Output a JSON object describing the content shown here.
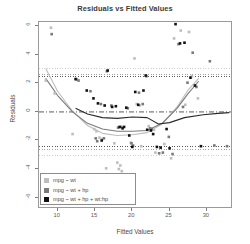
{
  "chart_data": {
    "type": "scatter",
    "title": "Residuals vs Fitted Values",
    "xlabel": "Fitted Values",
    "ylabel": "Residuals",
    "xlim": [
      7.5,
      33.5
    ],
    "ylim": [
      -6.8,
      6.3
    ],
    "xticks": [
      10,
      15,
      20,
      25,
      30
    ],
    "yticks": [
      6,
      4,
      2,
      0,
      -2,
      -4,
      -6
    ],
    "grid": false,
    "legend_position": "bottom-left",
    "zero_line": 0,
    "series": [
      {
        "name": "mpg ~ wt",
        "color": "#bdbdbd",
        "sd_band": [
          3.05,
          -3.05
        ],
        "points": [
          {
            "x": 8.4,
            "y": 2.2
          },
          {
            "x": 9.1,
            "y": 5.9
          },
          {
            "x": 9.6,
            "y": 1.3
          },
          {
            "x": 12.0,
            "y": -1.55
          },
          {
            "x": 12.6,
            "y": 2.25
          },
          {
            "x": 14.9,
            "y": -1.2
          },
          {
            "x": 15.2,
            "y": -1.35
          },
          {
            "x": 15.6,
            "y": -1.8
          },
          {
            "x": 16.0,
            "y": -1.9
          },
          {
            "x": 16.5,
            "y": -3.95
          },
          {
            "x": 17.6,
            "y": -2.2
          },
          {
            "x": 18.0,
            "y": -3.55
          },
          {
            "x": 18.2,
            "y": -4.0
          },
          {
            "x": 18.4,
            "y": -3.75
          },
          {
            "x": 18.6,
            "y": -4.15
          },
          {
            "x": 19.0,
            "y": -4.75
          },
          {
            "x": 19.8,
            "y": -2.15
          },
          {
            "x": 20.3,
            "y": 3.75
          },
          {
            "x": 20.6,
            "y": 0.55
          },
          {
            "x": 21.0,
            "y": 0.45
          },
          {
            "x": 21.2,
            "y": -2.4
          },
          {
            "x": 22.2,
            "y": -1.0
          },
          {
            "x": 22.9,
            "y": -1.25
          },
          {
            "x": 23.1,
            "y": -2.85
          },
          {
            "x": 24.3,
            "y": -2.25
          },
          {
            "x": 25.2,
            "y": -3.25
          },
          {
            "x": 25.6,
            "y": 5.15
          },
          {
            "x": 26.5,
            "y": 5.7
          },
          {
            "x": 27.1,
            "y": 0.5
          },
          {
            "x": 27.6,
            "y": 5.6
          },
          {
            "x": 28.0,
            "y": 2.5
          },
          {
            "x": 28.8,
            "y": 0.95
          }
        ]
      },
      {
        "name": "mpg ~ wt + hp",
        "color": "#7a7a7a",
        "sd_band": [
          2.65,
          -2.65
        ],
        "points": [
          {
            "x": 9.2,
            "y": 5.45
          },
          {
            "x": 12.5,
            "y": 2.3
          },
          {
            "x": 12.8,
            "y": 2.2
          },
          {
            "x": 14.4,
            "y": 1.45
          },
          {
            "x": 15.1,
            "y": -1.85
          },
          {
            "x": 15.3,
            "y": -2.05
          },
          {
            "x": 15.8,
            "y": 0.55
          },
          {
            "x": 16.2,
            "y": -1.85
          },
          {
            "x": 16.6,
            "y": 2.85
          },
          {
            "x": 17.2,
            "y": 0.45
          },
          {
            "x": 18.1,
            "y": -1.1
          },
          {
            "x": 18.5,
            "y": -1.05
          },
          {
            "x": 19.4,
            "y": 0.25
          },
          {
            "x": 19.9,
            "y": -2.2
          },
          {
            "x": 20.1,
            "y": -2.35
          },
          {
            "x": 20.9,
            "y": 1.35
          },
          {
            "x": 21.4,
            "y": 0.55
          },
          {
            "x": 21.9,
            "y": 2.5
          },
          {
            "x": 22.4,
            "y": -1.15
          },
          {
            "x": 22.6,
            "y": -1.2
          },
          {
            "x": 23.6,
            "y": -2.9
          },
          {
            "x": 24.1,
            "y": -2.85
          },
          {
            "x": 24.9,
            "y": -1.75
          },
          {
            "x": 25.4,
            "y": -2.95
          },
          {
            "x": 26.2,
            "y": 4.75
          },
          {
            "x": 26.8,
            "y": 0.35
          },
          {
            "x": 27.4,
            "y": 2.05
          },
          {
            "x": 28.1,
            "y": 4.15
          },
          {
            "x": 28.6,
            "y": 1.75
          },
          {
            "x": 30.4,
            "y": 3.55
          },
          {
            "x": 31.0,
            "y": -2.35
          },
          {
            "x": 32.7,
            "y": -2.4
          }
        ]
      },
      {
        "name": "mpg ~ wt + hp + wt:hp",
        "color": "#111111",
        "sd_band": [
          2.45,
          -2.45
        ],
        "points": [
          {
            "x": 12.4,
            "y": 2.3
          },
          {
            "x": 13.9,
            "y": 1.5
          },
          {
            "x": 14.8,
            "y": 0.95
          },
          {
            "x": 15.4,
            "y": 0.6
          },
          {
            "x": 15.9,
            "y": -2.0
          },
          {
            "x": 16.3,
            "y": 0.45
          },
          {
            "x": 16.7,
            "y": 2.9
          },
          {
            "x": 17.3,
            "y": 0.35
          },
          {
            "x": 17.8,
            "y": 0.4
          },
          {
            "x": 18.3,
            "y": -1.05
          },
          {
            "x": 18.7,
            "y": -1.15
          },
          {
            "x": 18.9,
            "y": -1.05
          },
          {
            "x": 19.2,
            "y": 0.3
          },
          {
            "x": 19.6,
            "y": -1.65
          },
          {
            "x": 20.0,
            "y": -2.45
          },
          {
            "x": 20.4,
            "y": 1.4
          },
          {
            "x": 20.8,
            "y": 0.5
          },
          {
            "x": 21.5,
            "y": 1.5
          },
          {
            "x": 21.8,
            "y": 2.55
          },
          {
            "x": 22.0,
            "y": -1.25
          },
          {
            "x": 22.5,
            "y": -1.3
          },
          {
            "x": 22.8,
            "y": -1.55
          },
          {
            "x": 23.3,
            "y": -2.45
          },
          {
            "x": 23.8,
            "y": -2.5
          },
          {
            "x": 24.6,
            "y": -1.2
          },
          {
            "x": 25.0,
            "y": -2.55
          },
          {
            "x": 25.8,
            "y": 6.15
          },
          {
            "x": 26.4,
            "y": 4.8
          },
          {
            "x": 27.0,
            "y": 4.85
          },
          {
            "x": 27.8,
            "y": 2.4
          },
          {
            "x": 28.4,
            "y": 1.85
          },
          {
            "x": 29.2,
            "y": -2.4
          }
        ]
      }
    ],
    "smoothers": [
      {
        "name": "mpg ~ wt",
        "color": "#bdbdbd",
        "points": [
          {
            "x": 8.4,
            "y": 3.05
          },
          {
            "x": 10.0,
            "y": 1.45
          },
          {
            "x": 12.0,
            "y": 0.05
          },
          {
            "x": 14.0,
            "y": -0.95
          },
          {
            "x": 16.0,
            "y": -1.5
          },
          {
            "x": 18.0,
            "y": -1.65
          },
          {
            "x": 20.0,
            "y": -1.6
          },
          {
            "x": 22.0,
            "y": -1.45
          },
          {
            "x": 24.0,
            "y": -0.85
          },
          {
            "x": 26.0,
            "y": 0.35
          },
          {
            "x": 27.5,
            "y": 1.55
          },
          {
            "x": 28.9,
            "y": 2.35
          }
        ]
      },
      {
        "name": "mpg ~ wt + hp",
        "color": "#7a7a7a",
        "points": [
          {
            "x": 8.4,
            "y": 2.35
          },
          {
            "x": 10.0,
            "y": 1.15
          },
          {
            "x": 12.0,
            "y": 0.0
          },
          {
            "x": 14.0,
            "y": -0.8
          },
          {
            "x": 16.0,
            "y": -1.2
          },
          {
            "x": 18.0,
            "y": -1.35
          },
          {
            "x": 20.0,
            "y": -1.35
          },
          {
            "x": 22.0,
            "y": -1.3
          },
          {
            "x": 24.0,
            "y": -0.8
          },
          {
            "x": 26.0,
            "y": 0.25
          },
          {
            "x": 27.5,
            "y": 1.3
          },
          {
            "x": 28.9,
            "y": 2.15
          }
        ]
      },
      {
        "name": "mpg ~ wt + hp + wt:hp",
        "color": "#2b2b2b",
        "points": [
          {
            "x": 12.4,
            "y": 0.25
          },
          {
            "x": 14.0,
            "y": -0.15
          },
          {
            "x": 16.0,
            "y": -0.4
          },
          {
            "x": 18.0,
            "y": -0.45
          },
          {
            "x": 20.0,
            "y": -0.35
          },
          {
            "x": 22.0,
            "y": -0.4
          },
          {
            "x": 23.5,
            "y": -0.85
          },
          {
            "x": 25.0,
            "y": -0.75
          },
          {
            "x": 27.0,
            "y": -0.4
          },
          {
            "x": 29.5,
            "y": -0.2
          },
          {
            "x": 31.5,
            "y": -0.1
          },
          {
            "x": 33.0,
            "y": -0.05
          }
        ]
      }
    ],
    "legend": [
      {
        "label": "mpg ~ wt",
        "color": "#bdbdbd"
      },
      {
        "label": "mpg ~ wt + hp",
        "color": "#7a7a7a"
      },
      {
        "label": "mpg ~ wt + hp + wt:hp",
        "color": "#111111"
      }
    ]
  }
}
